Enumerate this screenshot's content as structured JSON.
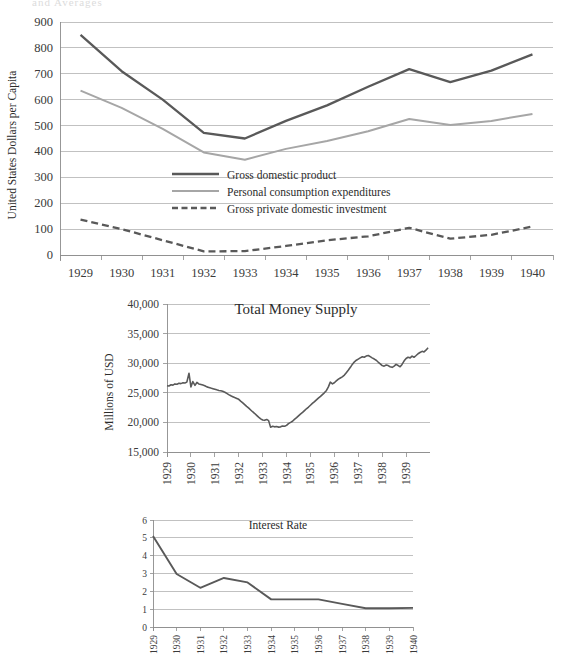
{
  "document": {
    "clipped_header_text": "and Averages"
  },
  "colors": {
    "gdp_line": "#595959",
    "pce_line": "#a6a6a6",
    "investment_line": "#595959",
    "money_line": "#595959",
    "interest_line": "#595959",
    "gridline": "#a6a6a6",
    "axis": "#8c8c8c",
    "text": "#2b2b2b",
    "background": "#ffffff"
  },
  "chart_data": [
    {
      "id": "gdp-chart",
      "type": "line",
      "title": "",
      "xlabel": "",
      "ylabel": "United States Dollars per Capita",
      "categories": [
        1929,
        1930,
        1931,
        1932,
        1933,
        1934,
        1935,
        1936,
        1937,
        1938,
        1939,
        1940
      ],
      "xtick_labels": [
        "1929",
        "1930",
        "1931",
        "1932",
        "1933",
        "1934",
        "1935",
        "1936",
        "1937",
        "1938",
        "1939",
        "1940"
      ],
      "ytick_labels": [
        "0",
        "100",
        "200",
        "300",
        "400",
        "500",
        "600",
        "700",
        "800",
        "900"
      ],
      "ylim": [
        0,
        900
      ],
      "ytick_step": 100,
      "grid": true,
      "legend_position": "inside-center",
      "series": [
        {
          "name": "Gross domestic product",
          "style": "solid-thick",
          "color": "#595959",
          "values": [
            850,
            710,
            600,
            472,
            450,
            518,
            578,
            650,
            718,
            668,
            712,
            775
          ]
        },
        {
          "name": "Personal consumption expenditures",
          "style": "solid-thin",
          "color": "#a6a6a6",
          "values": [
            635,
            568,
            487,
            396,
            368,
            410,
            440,
            478,
            525,
            502,
            518,
            545
          ]
        },
        {
          "name": "Gross private domestic investment",
          "style": "dashed",
          "color": "#595959",
          "values": [
            137,
            100,
            57,
            14,
            15,
            35,
            57,
            72,
            105,
            63,
            78,
            110
          ]
        }
      ]
    },
    {
      "id": "money-supply-chart",
      "type": "line",
      "title": "Total Money Supply",
      "xlabel": "",
      "ylabel": "Millions of USD",
      "ylim": [
        15000,
        40000
      ],
      "ytick_step": 5000,
      "ytick_labels": [
        "15,000",
        "20,000",
        "25,000",
        "30,000",
        "35,000",
        "40,000"
      ],
      "xtick_labels": [
        "1929",
        "1930",
        "1931",
        "1932",
        "1933",
        "1934",
        "1935",
        "1936",
        "1937",
        "1938",
        "1939"
      ],
      "xlim": [
        1929,
        1940
      ],
      "grid": true,
      "series": [
        {
          "name": "Total Money Supply",
          "style": "solid",
          "color": "#595959",
          "x": [
            1929.0,
            1929.08,
            1929.17,
            1929.25,
            1929.33,
            1929.42,
            1929.5,
            1929.58,
            1929.67,
            1929.75,
            1929.83,
            1929.92,
            1930.0,
            1930.08,
            1930.17,
            1930.25,
            1930.33,
            1930.42,
            1930.5,
            1930.58,
            1930.67,
            1930.75,
            1930.83,
            1930.92,
            1931.0,
            1931.08,
            1931.17,
            1931.25,
            1931.33,
            1931.42,
            1931.5,
            1931.58,
            1931.67,
            1931.75,
            1931.83,
            1931.92,
            1932.0,
            1932.08,
            1932.17,
            1932.25,
            1932.33,
            1932.42,
            1932.5,
            1932.58,
            1932.67,
            1932.75,
            1932.83,
            1932.92,
            1933.0,
            1933.08,
            1933.17,
            1933.25,
            1933.33,
            1933.42,
            1933.5,
            1933.58,
            1933.67,
            1933.75,
            1933.83,
            1933.92,
            1934.0,
            1934.08,
            1934.17,
            1934.25,
            1934.33,
            1934.42,
            1934.5,
            1934.58,
            1934.67,
            1934.75,
            1934.83,
            1934.92,
            1935.0,
            1935.08,
            1935.17,
            1935.25,
            1935.33,
            1935.42,
            1935.5,
            1935.58,
            1935.67,
            1935.75,
            1935.83,
            1935.92,
            1936.0,
            1936.08,
            1936.17,
            1936.25,
            1936.33,
            1936.42,
            1936.5,
            1936.58,
            1936.67,
            1936.75,
            1936.83,
            1936.92,
            1937.0,
            1937.08,
            1937.17,
            1937.25,
            1937.33,
            1937.42,
            1937.5,
            1937.58,
            1937.67,
            1937.75,
            1937.83,
            1937.92,
            1938.0,
            1938.08,
            1938.17,
            1938.25,
            1938.33,
            1938.42,
            1938.5,
            1938.58,
            1938.67,
            1938.75,
            1938.83,
            1938.92,
            1939.0,
            1939.08,
            1939.17,
            1939.25,
            1939.33,
            1939.42,
            1939.5,
            1939.58,
            1939.67,
            1939.75,
            1939.83,
            1939.92
          ],
          "values": [
            26200,
            26150,
            26350,
            26300,
            26500,
            26450,
            26600,
            26550,
            26700,
            26650,
            26800,
            28300,
            26000,
            26900,
            26250,
            26750,
            26500,
            26400,
            26300,
            26200,
            26000,
            25900,
            25800,
            25700,
            25600,
            25500,
            25400,
            25350,
            25250,
            25100,
            24900,
            24700,
            24500,
            24350,
            24200,
            24050,
            23900,
            23600,
            23300,
            23000,
            22700,
            22400,
            22100,
            21800,
            21500,
            21200,
            20900,
            20600,
            20400,
            20350,
            20500,
            20300,
            19200,
            19350,
            19250,
            19300,
            19200,
            19250,
            19400,
            19350,
            19500,
            19800,
            20000,
            20200,
            20500,
            20800,
            21100,
            21400,
            21700,
            22000,
            22300,
            22600,
            22900,
            23200,
            23500,
            23800,
            24100,
            24400,
            24700,
            25000,
            25400,
            26000,
            26800,
            26500,
            26700,
            27000,
            27300,
            27500,
            27700,
            28000,
            28400,
            28800,
            29300,
            29800,
            30200,
            30500,
            30700,
            30900,
            31100,
            31000,
            31200,
            31300,
            31100,
            30900,
            30700,
            30500,
            30200,
            29900,
            29600,
            29500,
            29700,
            29600,
            29400,
            29300,
            29500,
            29800,
            29600,
            29400,
            29800,
            30400,
            30800,
            31000,
            30900,
            31200,
            31000,
            31300,
            31600,
            31800,
            32000,
            31900,
            32200,
            32600
          ]
        }
      ]
    },
    {
      "id": "interest-rate-chart",
      "type": "line",
      "title": "Interest Rate",
      "xlabel": "",
      "ylabel": "",
      "ylim": [
        0,
        6
      ],
      "ytick_step": 1,
      "ytick_labels": [
        "0",
        "1",
        "2",
        "3",
        "4",
        "5",
        "6"
      ],
      "xtick_labels": [
        "1929",
        "1930",
        "1931",
        "1932",
        "1933",
        "1934",
        "1935",
        "1936",
        "1937",
        "1938",
        "1939",
        "1940"
      ],
      "xtick_labels_clipped": true,
      "categories": [
        1929,
        1930,
        1931,
        1932,
        1933,
        1934,
        1935,
        1936,
        1937,
        1938,
        1939,
        1940
      ],
      "grid": true,
      "series": [
        {
          "name": "Interest Rate",
          "style": "solid",
          "color": "#595959",
          "values": [
            5.1,
            2.97,
            2.2,
            2.75,
            2.5,
            1.55,
            1.55,
            1.55,
            1.3,
            1.05,
            1.05,
            1.07
          ]
        }
      ]
    }
  ]
}
